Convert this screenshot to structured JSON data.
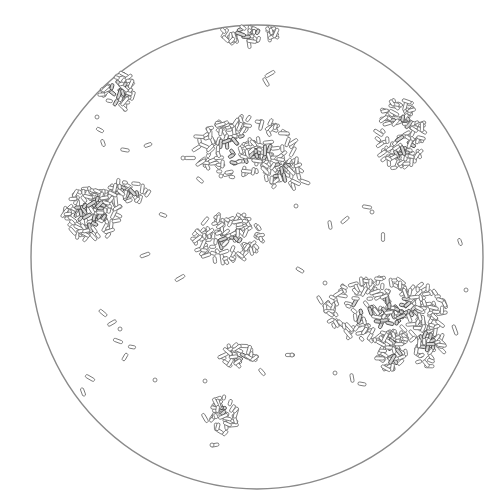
{
  "figure": {
    "caption_visible": "",
    "colors": {
      "ink": "#6a6a6a",
      "ink_dark": "#3c3c3c",
      "paper": "#ffffff",
      "circle": "#8a8a8a"
    },
    "field_circle": {
      "cx": 257,
      "cy": 257,
      "rx": 226,
      "ry": 232
    },
    "clusters": [
      {
        "name": "top-edge-cluster",
        "cx": 246,
        "cy": 34,
        "rx": 30,
        "ry": 10,
        "count": 45
      },
      {
        "name": "top-left-cluster",
        "cx": 118,
        "cy": 93,
        "rx": 17,
        "ry": 20,
        "count": 45
      },
      {
        "name": "upper-center-cluster",
        "cx": 245,
        "cy": 148,
        "rx": 52,
        "ry": 30,
        "count": 150
      },
      {
        "name": "upper-center-tail",
        "cx": 283,
        "cy": 172,
        "rx": 18,
        "ry": 18,
        "count": 40
      },
      {
        "name": "top-right-cluster",
        "cx": 400,
        "cy": 135,
        "rx": 24,
        "ry": 36,
        "count": 110
      },
      {
        "name": "left-cluster",
        "cx": 92,
        "cy": 214,
        "rx": 28,
        "ry": 26,
        "count": 110
      },
      {
        "name": "left-cluster-arm",
        "cx": 130,
        "cy": 190,
        "rx": 20,
        "ry": 12,
        "count": 30
      },
      {
        "name": "center-cluster",
        "cx": 228,
        "cy": 238,
        "rx": 34,
        "ry": 24,
        "count": 110
      },
      {
        "name": "right-large-cluster",
        "cx": 385,
        "cy": 310,
        "rx": 62,
        "ry": 32,
        "count": 220
      },
      {
        "name": "right-large-lobe-a",
        "cx": 392,
        "cy": 350,
        "rx": 14,
        "ry": 22,
        "count": 45
      },
      {
        "name": "right-large-lobe-b",
        "cx": 428,
        "cy": 345,
        "rx": 16,
        "ry": 22,
        "count": 45
      },
      {
        "name": "lower-center-cluster",
        "cx": 238,
        "cy": 355,
        "rx": 18,
        "ry": 11,
        "count": 30
      },
      {
        "name": "bottom-cluster",
        "cx": 224,
        "cy": 414,
        "rx": 12,
        "ry": 20,
        "count": 35
      }
    ],
    "scattered_rods": [
      [
        100,
        130,
        28
      ],
      [
        103,
        143,
        70
      ],
      [
        125,
        150,
        10
      ],
      [
        148,
        145,
        -20
      ],
      [
        190,
        158,
        0
      ],
      [
        200,
        180,
        40
      ],
      [
        266,
        82,
        60
      ],
      [
        270,
        74,
        -30
      ],
      [
        305,
        182,
        20
      ],
      [
        330,
        225,
        80
      ],
      [
        345,
        220,
        -40
      ],
      [
        367,
        207,
        10
      ],
      [
        383,
        237,
        90
      ],
      [
        460,
        242,
        70
      ],
      [
        180,
        278,
        -30
      ],
      [
        163,
        215,
        20
      ],
      [
        103,
        313,
        40
      ],
      [
        112,
        323,
        -30
      ],
      [
        118,
        341,
        20
      ],
      [
        125,
        357,
        -60
      ],
      [
        132,
        347,
        10
      ],
      [
        90,
        378,
        30
      ],
      [
        83,
        392,
        70
      ],
      [
        352,
        378,
        80
      ],
      [
        362,
        384,
        10
      ],
      [
        205,
        418,
        60
      ],
      [
        215,
        445,
        -10
      ],
      [
        290,
        355,
        0
      ],
      [
        262,
        372,
        50
      ],
      [
        145,
        255,
        -20
      ],
      [
        300,
        270,
        30
      ],
      [
        320,
        300,
        60
      ],
      [
        440,
        300,
        20
      ],
      [
        455,
        330,
        70
      ]
    ],
    "scattered_cocci": [
      [
        183,
        158
      ],
      [
        221,
        176
      ],
      [
        97,
        117
      ],
      [
        155,
        380
      ],
      [
        205,
        381
      ],
      [
        466,
        290
      ],
      [
        325,
        283
      ],
      [
        372,
        212
      ],
      [
        335,
        373
      ],
      [
        292,
        355
      ],
      [
        244,
        215
      ],
      [
        296,
        206
      ],
      [
        212,
        445
      ],
      [
        120,
        329
      ]
    ]
  }
}
